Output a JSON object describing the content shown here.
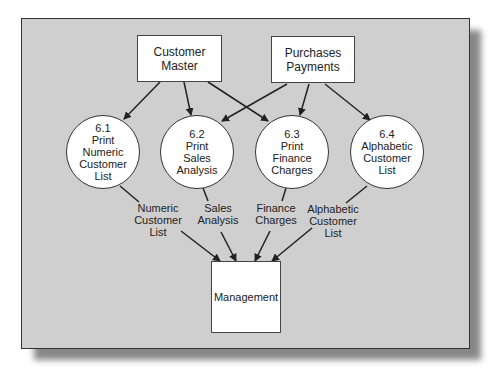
{
  "diagram": {
    "type": "data-flow-diagram",
    "sources": [
      {
        "id": "customer_master",
        "lines": [
          "Customer",
          "Master"
        ]
      },
      {
        "id": "purchases_payments",
        "lines": [
          "Purchases",
          "Payments"
        ]
      }
    ],
    "processes": [
      {
        "id": "6.1",
        "lines": [
          "6.1",
          "Print",
          "Numeric",
          "Customer",
          "List"
        ]
      },
      {
        "id": "6.2",
        "lines": [
          "6.2",
          "Print",
          "Sales",
          "Analysis"
        ]
      },
      {
        "id": "6.3",
        "lines": [
          "6.3",
          "Print",
          "Finance",
          "Charges"
        ]
      },
      {
        "id": "6.4",
        "lines": [
          "6.4",
          "Alphabetic",
          "Customer",
          "List"
        ]
      }
    ],
    "flows": [
      {
        "lines": [
          "Numeric",
          "Customer",
          "List"
        ]
      },
      {
        "lines": [
          "Sales",
          "Analysis"
        ]
      },
      {
        "lines": [
          "Finance",
          "Charges"
        ]
      },
      {
        "lines": [
          "Alphabetic",
          "Customer",
          "List"
        ]
      }
    ],
    "sink": {
      "lines": [
        "Management"
      ]
    },
    "colors": {
      "panel": "#cfcfcf",
      "box": "#ffffff",
      "stroke": "#222222"
    }
  }
}
